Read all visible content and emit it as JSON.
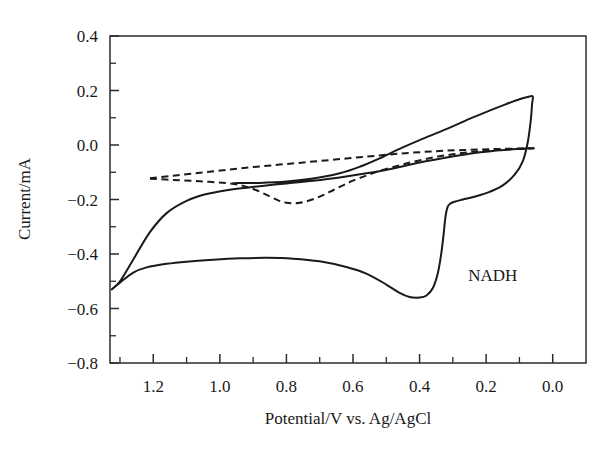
{
  "chart_data": {
    "type": "line",
    "title": "",
    "xlabel": "Potential/V vs. Ag/AgCl",
    "ylabel": "Current/mA",
    "xlim": [
      1.33,
      -0.1
    ],
    "ylim": [
      -0.8,
      0.4
    ],
    "x_reversed": true,
    "grid": false,
    "legend": "none",
    "xticks": [
      1.2,
      1.0,
      0.8,
      0.6,
      0.4,
      0.2,
      0.0
    ],
    "xticklabels": [
      "1.2",
      "1.0",
      "0.8",
      "0.6",
      "0.4",
      "0.2",
      "0.0"
    ],
    "x_minor_interval": 0.1,
    "yticks": [
      0.4,
      0.2,
      0.0,
      -0.2,
      -0.4,
      -0.6,
      -0.8
    ],
    "yticklabels": [
      "0.4",
      "0.2",
      "0.0",
      "-0.2",
      "-0.4",
      "-0.6",
      "-0.8"
    ],
    "y_minor_interval": 0.1,
    "annotations": [
      {
        "text": "NADH",
        "x": 0.18,
        "y": -0.5
      }
    ],
    "series": [
      {
        "name": "NADH cyclic voltammogram (solid)",
        "style": "solid",
        "points": [
          [
            0.07,
            -0.012
          ],
          [
            0.12,
            -0.016
          ],
          [
            0.18,
            -0.022
          ],
          [
            0.25,
            -0.032
          ],
          [
            0.32,
            -0.046
          ],
          [
            0.4,
            -0.064
          ],
          [
            0.48,
            -0.086
          ],
          [
            0.56,
            -0.104
          ],
          [
            0.64,
            -0.119
          ],
          [
            0.72,
            -0.131
          ],
          [
            0.8,
            -0.141
          ],
          [
            0.88,
            -0.151
          ],
          [
            0.96,
            -0.162
          ],
          [
            1.04,
            -0.18
          ],
          [
            1.1,
            -0.205
          ],
          [
            1.16,
            -0.25
          ],
          [
            1.21,
            -0.32
          ],
          [
            1.26,
            -0.42
          ],
          [
            1.3,
            -0.5
          ],
          [
            1.325,
            -0.53
          ],
          [
            1.3,
            -0.505
          ],
          [
            1.26,
            -0.468
          ],
          [
            1.22,
            -0.449
          ],
          [
            1.16,
            -0.436
          ],
          [
            1.1,
            -0.428
          ],
          [
            1.02,
            -0.421
          ],
          [
            0.94,
            -0.416
          ],
          [
            0.86,
            -0.414
          ],
          [
            0.78,
            -0.417
          ],
          [
            0.7,
            -0.427
          ],
          [
            0.62,
            -0.448
          ],
          [
            0.56,
            -0.472
          ],
          [
            0.5,
            -0.512
          ],
          [
            0.46,
            -0.543
          ],
          [
            0.43,
            -0.558
          ],
          [
            0.4,
            -0.56
          ],
          [
            0.38,
            -0.553
          ],
          [
            0.36,
            -0.525
          ],
          [
            0.345,
            -0.47
          ],
          [
            0.335,
            -0.4
          ],
          [
            0.328,
            -0.33
          ],
          [
            0.322,
            -0.262
          ],
          [
            0.316,
            -0.228
          ],
          [
            0.308,
            -0.215
          ],
          [
            0.295,
            -0.208
          ],
          [
            0.27,
            -0.2
          ],
          [
            0.23,
            -0.188
          ],
          [
            0.19,
            -0.172
          ],
          [
            0.15,
            -0.148
          ],
          [
            0.115,
            -0.11
          ],
          [
            0.09,
            -0.06
          ],
          [
            0.075,
            0.01
          ],
          [
            0.066,
            0.09
          ],
          [
            0.062,
            0.15
          ],
          [
            0.06,
            0.178
          ],
          [
            0.075,
            0.176
          ],
          [
            0.1,
            0.168
          ],
          [
            0.14,
            0.15
          ],
          [
            0.19,
            0.126
          ],
          [
            0.25,
            0.096
          ],
          [
            0.32,
            0.058
          ],
          [
            0.4,
            0.018
          ],
          [
            0.46,
            -0.014
          ],
          [
            0.52,
            -0.049
          ],
          [
            0.58,
            -0.08
          ],
          [
            0.64,
            -0.104
          ],
          [
            0.72,
            -0.123
          ],
          [
            0.8,
            -0.134
          ],
          [
            0.88,
            -0.139
          ],
          [
            0.96,
            -0.14
          ]
        ]
      },
      {
        "name": "background upper (dashed)",
        "style": "dashed",
        "points": [
          [
            1.21,
            -0.122
          ],
          [
            1.14,
            -0.113
          ],
          [
            1.06,
            -0.102
          ],
          [
            0.98,
            -0.091
          ],
          [
            0.9,
            -0.081
          ],
          [
            0.82,
            -0.072
          ],
          [
            0.74,
            -0.063
          ],
          [
            0.66,
            -0.054
          ],
          [
            0.58,
            -0.045
          ],
          [
            0.5,
            -0.036
          ],
          [
            0.42,
            -0.028
          ],
          [
            0.34,
            -0.022
          ],
          [
            0.26,
            -0.018
          ],
          [
            0.18,
            -0.015
          ],
          [
            0.1,
            -0.013
          ],
          [
            0.055,
            -0.012
          ]
        ]
      },
      {
        "name": "background lower with reduction dip (dashed)",
        "style": "dashed",
        "points": [
          [
            1.21,
            -0.124
          ],
          [
            1.14,
            -0.128
          ],
          [
            1.06,
            -0.133
          ],
          [
            0.98,
            -0.14
          ],
          [
            0.93,
            -0.15
          ],
          [
            0.89,
            -0.166
          ],
          [
            0.855,
            -0.186
          ],
          [
            0.825,
            -0.203
          ],
          [
            0.8,
            -0.212
          ],
          [
            0.775,
            -0.214
          ],
          [
            0.75,
            -0.21
          ],
          [
            0.72,
            -0.199
          ],
          [
            0.69,
            -0.184
          ],
          [
            0.66,
            -0.166
          ],
          [
            0.63,
            -0.148
          ],
          [
            0.6,
            -0.131
          ],
          [
            0.56,
            -0.112
          ],
          [
            0.52,
            -0.095
          ],
          [
            0.47,
            -0.078
          ],
          [
            0.42,
            -0.062
          ],
          [
            0.36,
            -0.046
          ],
          [
            0.3,
            -0.034
          ],
          [
            0.24,
            -0.025
          ],
          [
            0.18,
            -0.019
          ],
          [
            0.12,
            -0.015
          ],
          [
            0.055,
            -0.012
          ]
        ]
      }
    ]
  }
}
